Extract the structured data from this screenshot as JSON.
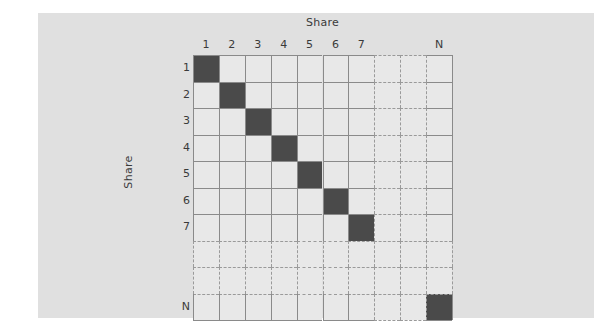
{
  "figure": {
    "top_axis_label": "Share",
    "left_axis_label": "Share",
    "background_color": "#e0e0e0",
    "cell_color": "#e8e8e8",
    "filled_color": "#4a4a4a",
    "gridline_color": "#8a8a8a",
    "dashed_color": "#9a9a9a"
  },
  "chart_data": {
    "type": "heatmap",
    "title": "",
    "xlabel": "Share",
    "ylabel": "Share",
    "x_tick_labels": [
      "1",
      "2",
      "3",
      "4",
      "5",
      "6",
      "7",
      "",
      "",
      "N"
    ],
    "y_tick_labels": [
      "1",
      "2",
      "3",
      "4",
      "5",
      "6",
      "7",
      "",
      "",
      "N"
    ],
    "categories": [
      "1",
      "2",
      "3",
      "4",
      "5",
      "6",
      "7",
      "",
      "",
      "N"
    ],
    "grid": true,
    "legend": "none",
    "note": "Identity-style matrix: only diagonal entries are filled; rows/columns 8 and 9 are elided (dashed) to indicate continuation up to N.",
    "values": [
      [
        1,
        0,
        0,
        0,
        0,
        0,
        0,
        0,
        0,
        0
      ],
      [
        0,
        1,
        0,
        0,
        0,
        0,
        0,
        0,
        0,
        0
      ],
      [
        0,
        0,
        1,
        0,
        0,
        0,
        0,
        0,
        0,
        0
      ],
      [
        0,
        0,
        0,
        1,
        0,
        0,
        0,
        0,
        0,
        0
      ],
      [
        0,
        0,
        0,
        0,
        1,
        0,
        0,
        0,
        0,
        0
      ],
      [
        0,
        0,
        0,
        0,
        0,
        1,
        0,
        0,
        0,
        0
      ],
      [
        0,
        0,
        0,
        0,
        0,
        0,
        1,
        0,
        0,
        0
      ],
      [
        0,
        0,
        0,
        0,
        0,
        0,
        0,
        0,
        0,
        0
      ],
      [
        0,
        0,
        0,
        0,
        0,
        0,
        0,
        0,
        0,
        0
      ],
      [
        0,
        0,
        0,
        0,
        0,
        0,
        0,
        0,
        0,
        1
      ]
    ],
    "filled_diagonal_indices": [
      0,
      1,
      2,
      3,
      4,
      5,
      6,
      9
    ],
    "elided_indices": [
      7,
      8
    ]
  },
  "columns": [
    {
      "label": "1",
      "index": 0,
      "style": "solid"
    },
    {
      "label": "2",
      "index": 1,
      "style": "solid"
    },
    {
      "label": "3",
      "index": 2,
      "style": "solid"
    },
    {
      "label": "4",
      "index": 3,
      "style": "solid"
    },
    {
      "label": "5",
      "index": 4,
      "style": "solid"
    },
    {
      "label": "6",
      "index": 5,
      "style": "solid"
    },
    {
      "label": "7",
      "index": 6,
      "style": "solid"
    },
    {
      "label": "",
      "index": 7,
      "style": "dashed"
    },
    {
      "label": "",
      "index": 8,
      "style": "dashed"
    },
    {
      "label": "N",
      "index": 9,
      "style": "solid"
    }
  ],
  "rows": [
    {
      "label": "1",
      "index": 0,
      "style": "solid"
    },
    {
      "label": "2",
      "index": 1,
      "style": "solid"
    },
    {
      "label": "3",
      "index": 2,
      "style": "solid"
    },
    {
      "label": "4",
      "index": 3,
      "style": "solid"
    },
    {
      "label": "5",
      "index": 4,
      "style": "solid"
    },
    {
      "label": "6",
      "index": 5,
      "style": "solid"
    },
    {
      "label": "7",
      "index": 6,
      "style": "solid"
    },
    {
      "label": "",
      "index": 7,
      "style": "dashed"
    },
    {
      "label": "",
      "index": 8,
      "style": "dashed"
    },
    {
      "label": "N",
      "index": 9,
      "style": "solid"
    }
  ]
}
